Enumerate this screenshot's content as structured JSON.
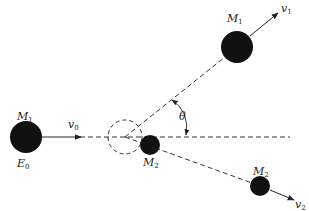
{
  "diagram": {
    "type": "elastic-collision",
    "labels": {
      "m1_initial": {
        "main": "M",
        "sub": "1"
      },
      "e0": {
        "main": "E",
        "sub": "0"
      },
      "v0": {
        "main": "v",
        "sub": "0"
      },
      "m2_initial": {
        "main": "M",
        "sub": "2"
      },
      "m1_final": {
        "main": "M",
        "sub": "1"
      },
      "v1": {
        "main": "v",
        "sub": "1"
      },
      "m2_final": {
        "main": "M",
        "sub": "2"
      },
      "v2": {
        "main": "v",
        "sub": "2"
      },
      "theta": "θ"
    },
    "colors": {
      "ball": "#111111",
      "line": "#333333",
      "background": "#ffffff"
    }
  }
}
